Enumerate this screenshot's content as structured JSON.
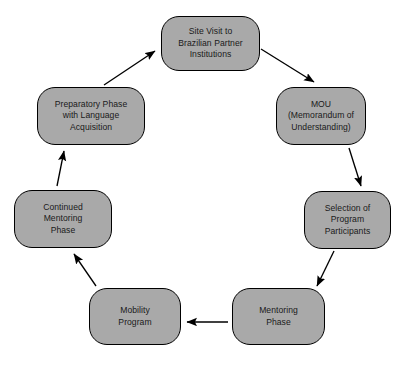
{
  "diagram": {
    "type": "cyclical-process-flow",
    "direction": "clockwise",
    "node_fill_color": "#a9a9a9",
    "node_border_color": "#000000",
    "arrow_color": "#000000",
    "background_color": "#ffffff",
    "nodes": [
      {
        "id": "site-visit",
        "label": "Site Visit to\nBrazilian Partner\nInstitutions",
        "position": "top"
      },
      {
        "id": "mou",
        "label": "MOU\n(Memorandum of\nUnderstanding)",
        "position": "upper-right"
      },
      {
        "id": "selection",
        "label": "Selection of\nProgram\nParticipants",
        "position": "right"
      },
      {
        "id": "mentoring-phase",
        "label": "Mentoring\nPhase",
        "position": "lower-right"
      },
      {
        "id": "mobility-program",
        "label": "Mobility\nProgram",
        "position": "lower-left"
      },
      {
        "id": "continued-mentoring",
        "label": "Continued\nMentoring\nPhase",
        "position": "left"
      },
      {
        "id": "preparatory-phase",
        "label": "Preparatory Phase\nwith Language\nAcquisition",
        "position": "upper-left"
      }
    ],
    "edges": [
      {
        "from": "site-visit",
        "to": "mou"
      },
      {
        "from": "mou",
        "to": "selection"
      },
      {
        "from": "selection",
        "to": "mentoring-phase"
      },
      {
        "from": "mentoring-phase",
        "to": "mobility-program"
      },
      {
        "from": "mobility-program",
        "to": "continued-mentoring"
      },
      {
        "from": "continued-mentoring",
        "to": "preparatory-phase"
      },
      {
        "from": "preparatory-phase",
        "to": "site-visit"
      }
    ]
  }
}
